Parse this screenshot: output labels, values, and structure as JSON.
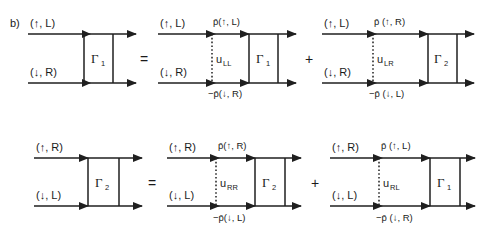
{
  "figure": {
    "panel_label": "b)",
    "background_color": "#ffffff",
    "ink_color": "#1f1f1f"
  },
  "symbols": {
    "equals": "=",
    "plus": "+",
    "gamma1": "Γ",
    "gamma2": "Γ",
    "sub1": "1",
    "sub2": "2",
    "up_left": "(↑, L)",
    "down_right": "(↓, R)",
    "up_right": "(↑, R)",
    "down_left": "(↓, L)"
  },
  "equations": [
    {
      "id": "row-1",
      "lhs": {
        "id": "diagram-gamma1-lhs",
        "vertex": "Γ",
        "vertex_sub": "1",
        "in_top": "(↑, L)",
        "in_bottom": "(↓, R)"
      },
      "operator_after_lhs": "=",
      "terms": [
        {
          "id": "diagram-term-ull",
          "interaction": "u",
          "interaction_sub": "LL",
          "in_top": "(↑, L)",
          "in_bottom": "(↓, R)",
          "prop_top": "p̄(↑, L)",
          "prop_bottom": "−p̄(↓, R)",
          "vertex": "Γ",
          "vertex_sub": "1"
        },
        {
          "id": "diagram-term-ulr",
          "interaction": "u",
          "interaction_sub": "LR",
          "in_top": "(↑, L)",
          "in_bottom": "(↓, R)",
          "prop_top": "p̄ (↑, R)",
          "prop_bottom": "−p̄ (↓, L)",
          "vertex": "Γ",
          "vertex_sub": "2"
        }
      ],
      "operator_between_terms": "+"
    },
    {
      "id": "row-2",
      "lhs": {
        "id": "diagram-gamma2-lhs",
        "vertex": "Γ",
        "vertex_sub": "2",
        "in_top": "(↑, R)",
        "in_bottom": "(↓, L)"
      },
      "operator_after_lhs": "=",
      "terms": [
        {
          "id": "diagram-term-urr",
          "interaction": "u",
          "interaction_sub": "RR",
          "in_top": "(↑, R)",
          "in_bottom": "(↓, L)",
          "prop_top": "p̄(↑, R)",
          "prop_bottom": "−p̄(↓, L)",
          "vertex": "Γ",
          "vertex_sub": "2"
        },
        {
          "id": "diagram-term-url",
          "interaction": "u",
          "interaction_sub": "RL",
          "in_top": "(↑, R)",
          "in_bottom": "(↓, L)",
          "prop_top": "p̄ (↑, L)",
          "prop_bottom": "−p̄ (↓, R)",
          "vertex": "Γ",
          "vertex_sub": "1"
        }
      ],
      "operator_between_terms": "+"
    }
  ]
}
